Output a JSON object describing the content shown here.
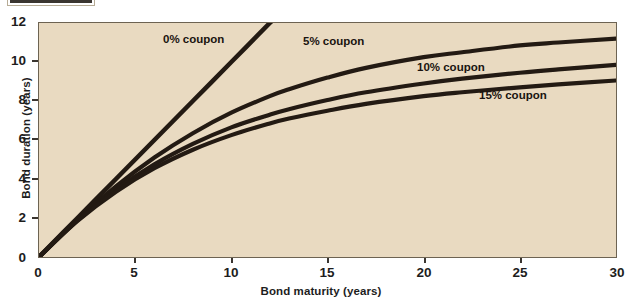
{
  "figure": {
    "background_color": "#ffffff",
    "plot_background_color": "#e9dac1",
    "curve_color": "#231a13",
    "axis_color": "#6d6352",
    "top_crop_label": ""
  },
  "chart_data": {
    "type": "line",
    "title": "",
    "xlabel": "Bond maturity (years)",
    "ylabel": "Bond duration (years)",
    "xlim": [
      0,
      30
    ],
    "ylim": [
      0,
      12
    ],
    "xticks": [
      0,
      5,
      10,
      15,
      20,
      25,
      30
    ],
    "yticks": [
      0,
      2,
      4,
      6,
      8,
      10,
      12
    ],
    "xticklabels": [
      "0",
      "5",
      "10",
      "15",
      "20",
      "25",
      "30"
    ],
    "yticklabels": [
      "0",
      "2",
      "4",
      "6",
      "8",
      "10",
      "12"
    ],
    "grid": false,
    "legend_position": "inline-annotations",
    "x": [
      0,
      2,
      4,
      6,
      8,
      10,
      12,
      13,
      15,
      17,
      20,
      22,
      25,
      27,
      30
    ],
    "series": [
      {
        "name": "0% coupon",
        "label": "0% coupon",
        "label_x": 8.3,
        "label_y": 11.2,
        "values": [
          0,
          2,
          4,
          6,
          8,
          10,
          12,
          13,
          15,
          17,
          20,
          22,
          25,
          27,
          30
        ],
        "clipped_at_y": 12,
        "exits_top_at_x": 12
      },
      {
        "name": "5% coupon",
        "label": "5% coupon",
        "label_x": 15.6,
        "label_y": 11.3,
        "values": [
          0,
          1.92,
          3.62,
          5.1,
          6.35,
          7.4,
          8.25,
          8.6,
          9.2,
          9.7,
          10.25,
          10.5,
          10.85,
          11.0,
          11.2
        ]
      },
      {
        "name": "10% coupon",
        "label": "10% coupon",
        "label_x": 21.6,
        "label_y": 10.0,
        "values": [
          0,
          1.88,
          3.45,
          4.75,
          5.8,
          6.65,
          7.3,
          7.58,
          8.05,
          8.45,
          8.9,
          9.15,
          9.45,
          9.62,
          9.85
        ]
      },
      {
        "name": "15% coupon",
        "label": "15% coupon",
        "label_x": 23.9,
        "label_y": 8.6,
        "values": [
          0,
          1.85,
          3.35,
          4.55,
          5.5,
          6.25,
          6.85,
          7.1,
          7.5,
          7.85,
          8.25,
          8.45,
          8.7,
          8.85,
          9.05
        ]
      }
    ]
  }
}
